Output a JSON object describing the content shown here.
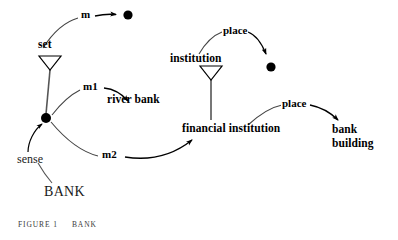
{
  "figure": {
    "caption_label": "FIGURE 1",
    "caption_title": "BANK",
    "root_word": "BANK",
    "root_relation": "sense"
  },
  "nodes": {
    "set": "set",
    "river_bank": "river bank",
    "institution": "institution",
    "financial_institution": "financial institution",
    "bank_building": "bank building"
  },
  "edges": {
    "m": "m",
    "m1": "m1",
    "m2": "m2",
    "place_institution": "place",
    "place_building": "place"
  },
  "colors": {
    "ink": "#000000",
    "background": "#ffffff",
    "stroke": "#3a3a3a"
  }
}
